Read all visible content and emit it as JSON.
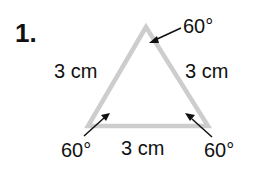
{
  "problem": {
    "number": "1."
  },
  "triangle": {
    "type": "equilateral",
    "line_color": "#cdcdcd",
    "sides": [
      {
        "position": "left",
        "label": "3 cm"
      },
      {
        "position": "right",
        "label": "3 cm"
      },
      {
        "position": "bottom",
        "label": "3 cm"
      }
    ],
    "angles": [
      {
        "vertex": "top",
        "label": "60°"
      },
      {
        "vertex": "bottom-left",
        "label": "60°"
      },
      {
        "vertex": "bottom-right",
        "label": "60°"
      }
    ]
  }
}
